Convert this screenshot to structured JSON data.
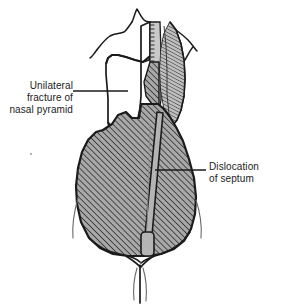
{
  "figure": {
    "view": "anteroposterior (frontal) view of the nose",
    "background_color": "#ffffff",
    "ink_color": "#1b1b1b",
    "bone_fill_color": "#ffffff",
    "hatched_fill_color": "#a8a8a8",
    "hatch_line_color": "#1b1b1b",
    "septum_fill_color": "#b4b4b4",
    "strip_fill_color": "#c9c9c9"
  },
  "annotations": [
    {
      "id": "unilateral-fracture",
      "side": "left",
      "align": "right",
      "lines": [
        "Unilateral",
        "fracture of",
        "nasal pyramid"
      ],
      "leader": {
        "x1": 73,
        "y1": 91,
        "x2": 128,
        "y2": 91
      },
      "points_to": "white unfractured nasal pyramid segment"
    },
    {
      "id": "septum-dislocation",
      "side": "right",
      "align": "left",
      "lines": [
        "Dislocation",
        "of septum"
      ],
      "leader": {
        "x1": 155,
        "y1": 170,
        "x2": 206,
        "y2": 170
      },
      "points_to": "displaced nasal septum bar"
    }
  ],
  "structures": {
    "head_outline": "forehead and brow silhouette with glabella notch",
    "nasal_pyramid_fragment": "unhatched bone fragment on the left of midline",
    "nasal_dorsum_strip": "narrow light strip along the midline with stippled edge",
    "displaced_nasal_bone": "hatched lens-shaped fragment right of midline",
    "nasal_soft_tissue": "large hatched teardrop forming lower two thirds of nose",
    "septum": "long narrow bar tilted from upper right to lower left",
    "columella_base": "small rounded rectangle at the foot of the septum",
    "nasal_tip_and_alae": "paired curved lobes at the base of the nose",
    "philtrum": "vertical line descending from the nasal base"
  }
}
